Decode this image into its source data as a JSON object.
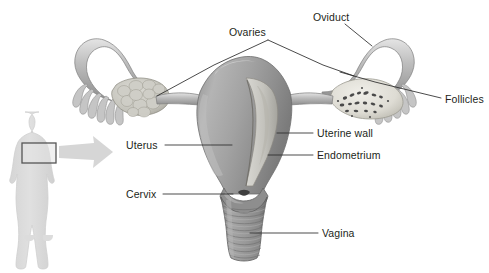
{
  "figure": {
    "title_text": "",
    "background_color": "#ffffff"
  },
  "colors": {
    "label_text": "#231f20",
    "leader_line": "#2b2b2b",
    "organ_mid_grey": "#9a9a9a",
    "organ_light_grey": "#c9c9c9",
    "organ_highlight": "#e2e2e2",
    "organ_shadow": "#6f6f6f",
    "ovary_pale": "#e6e5e0",
    "follicle_dark": "#4a4a4a",
    "silhouette_fill": "#dcdcdc",
    "silhouette_stroke": "#cfcfcf",
    "pelvis_box_stroke": "#555555",
    "arrow_fill": "#d6d6d6"
  },
  "labels": [
    {
      "id": "ovaries",
      "text": "Ovaries",
      "x": 229,
      "y": 27,
      "anchor": "start"
    },
    {
      "id": "oviduct",
      "text": "Oviduct",
      "x": 313,
      "y": 12,
      "anchor": "start"
    },
    {
      "id": "follicles",
      "text": "Follicles",
      "x": 445,
      "y": 94,
      "anchor": "start"
    },
    {
      "id": "uterus",
      "text": "Uterus",
      "x": 126,
      "y": 140,
      "anchor": "start"
    },
    {
      "id": "uterine_wall",
      "text": "Uterine wall",
      "x": 317,
      "y": 130,
      "anchor": "start"
    },
    {
      "id": "endometrium",
      "text": "Endometrium",
      "x": 317,
      "y": 151,
      "anchor": "start"
    },
    {
      "id": "cervix",
      "text": "Cervix",
      "x": 126,
      "y": 189,
      "anchor": "start"
    },
    {
      "id": "vagina",
      "text": "Vagina",
      "x": 322,
      "y": 228,
      "anchor": "start"
    }
  ],
  "leader_lines": [
    {
      "id": "ovaries-left-leader",
      "points": "268,40 214,65 157,96"
    },
    {
      "id": "ovaries-right-leader",
      "points": "268,40 323,65 354,76"
    },
    {
      "id": "oviduct-leader",
      "points": "345,24 372,46"
    },
    {
      "id": "follicles-leader",
      "points": "441,98 375,82 340,72"
    },
    {
      "id": "uterus-leader",
      "points": "165,145 232,145"
    },
    {
      "id": "uterine-wall-leader",
      "points": "313,133 277,133"
    },
    {
      "id": "endometrium-leader",
      "points": "313,155 268,155"
    },
    {
      "id": "cervix-leader",
      "points": "163,194 233,194"
    },
    {
      "id": "vagina-leader",
      "points": "318,233 250,233"
    }
  ],
  "body_figure": {
    "name": "female-body-silhouette",
    "pelvis_box": {
      "x": 22,
      "y": 143,
      "width": 34,
      "height": 20
    },
    "arrow": {
      "from_x": 60,
      "to_x": 113,
      "y": 152
    }
  },
  "organ_parts": [
    {
      "id": "left-oviduct",
      "name": "Oviduct (left fallopian tube)"
    },
    {
      "id": "left-fimbriae",
      "name": "Fimbriae (left)"
    },
    {
      "id": "left-ovary",
      "name": "Ovary (left, external view)"
    },
    {
      "id": "right-oviduct",
      "name": "Oviduct (right fallopian tube)"
    },
    {
      "id": "right-fimbriae",
      "name": "Fimbriae (right)"
    },
    {
      "id": "right-ovary",
      "name": "Ovary (right, sectioned with follicles)"
    },
    {
      "id": "uterus-body",
      "name": "Uterus body / fundus"
    },
    {
      "id": "myometrium",
      "name": "Uterine wall (myometrium)"
    },
    {
      "id": "endometrium",
      "name": "Endometrium lining uterine cavity"
    },
    {
      "id": "cervix",
      "name": "Cervix"
    },
    {
      "id": "vagina",
      "name": "Vagina with rugae"
    }
  ]
}
